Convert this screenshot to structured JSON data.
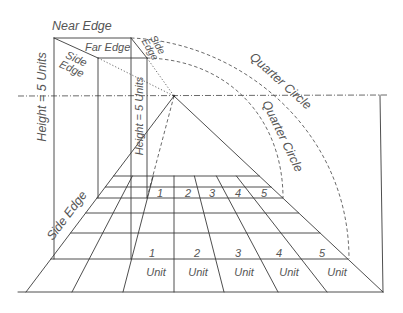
{
  "diagram": {
    "title": "",
    "labels": {
      "near_edge": "Near Edge",
      "far_edge": "Far Edge",
      "side_edge_top_left": {
        "line1": "Side",
        "line2": "Edge"
      },
      "side_edge_top_right": {
        "line1": "Side",
        "line2": "Edge"
      },
      "side_edge_bottom_left": "Side Edge",
      "height_outer": "Height = 5 Units",
      "height_inner": "Height = 5 Units",
      "quarter_circle_outer": "Quarter Circle",
      "quarter_circle_inner": "Quarter Circle"
    },
    "unit_grid": {
      "front_row_numbers": [
        "1",
        "2",
        "3",
        "4",
        "5"
      ],
      "front_row_unit_labels": [
        "Unit",
        "Unit",
        "Unit",
        "Unit",
        "Unit"
      ],
      "back_row_numbers": [
        "1",
        "2",
        "3",
        "4",
        "5"
      ]
    },
    "colors": {
      "line": "#3a3a3a",
      "text": "#555555",
      "background": "#ffffff"
    }
  }
}
